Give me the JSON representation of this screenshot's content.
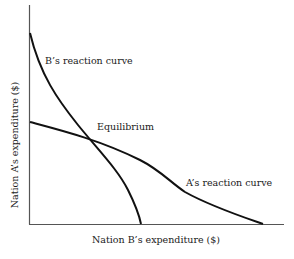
{
  "diagram": {
    "type": "reaction-curves",
    "axes": {
      "x_label": "Nation B’s expenditure ($)",
      "y_label": "Nation A’s expenditure ($)"
    },
    "curves": [
      {
        "name": "B’s reaction curve",
        "label": "B’s reaction curve"
      },
      {
        "name": "A’s reaction curve",
        "label": "A’s reaction curve"
      }
    ],
    "annotations": {
      "equilibrium": "Equilibrium"
    },
    "colors": {
      "line": "#111111",
      "axis": "#444444",
      "background": "#ffffff"
    }
  }
}
